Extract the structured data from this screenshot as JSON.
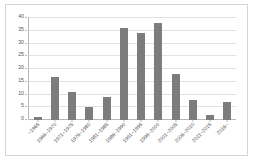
{
  "chart_data": {
    "type": "bar",
    "title": "",
    "subtitle": "",
    "xlabel": "",
    "ylabel": "",
    "categories": [
      "~1965",
      "1966~1970",
      "1971~1975",
      "1976~1980",
      "1981~1985",
      "1986~1990",
      "1991~1995",
      "1996~2000",
      "2001~2005",
      "2006~2010",
      "2011~2015",
      "2016~"
    ],
    "values": [
      1,
      17,
      11,
      5,
      9,
      36,
      34,
      38,
      18,
      8,
      2,
      7
    ],
    "ylim": [
      0,
      40
    ],
    "yticks": [
      0,
      5,
      10,
      15,
      20,
      25,
      30,
      35,
      40
    ],
    "ytick_labels": [
      "0",
      "5",
      "10",
      "15",
      "20",
      "25",
      "30",
      "35",
      "40"
    ],
    "grid": true,
    "legend": false,
    "legend_position": "none",
    "bar_color": "#7c7c7c",
    "gridline_color": "#e2e2e2",
    "axis_color": "#b8b8b8",
    "plot_background": "#ffffff",
    "frame_color": "#d4d4d4"
  }
}
